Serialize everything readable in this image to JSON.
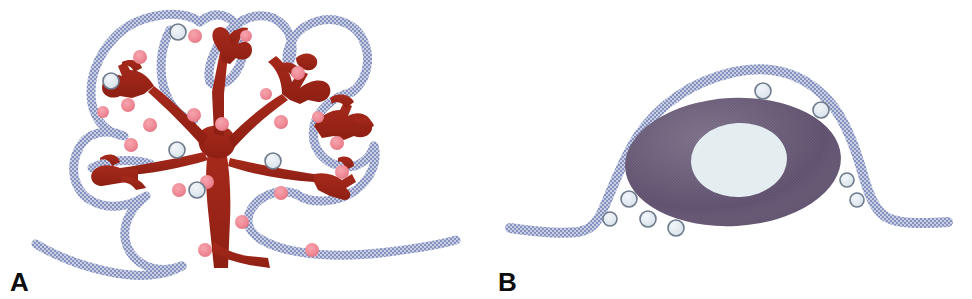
{
  "figure": {
    "kind": "scientific-illustration",
    "background_color": "#ffffff",
    "width": 972,
    "height": 299
  },
  "palette": {
    "membrane_blue": "#8f9bc4",
    "membrane_blue_light": "#c3cbe3",
    "membrane_outline": "#9aa5cb",
    "cytoplasm_red": "#a02418",
    "cytoplasm_red_dark": "#8d1f14",
    "granule_pink": "#ef8a96",
    "granule_pink_edge": "#e06878",
    "vesicle_fill": "#dfe7ee",
    "vesicle_stroke": "#6f7b8c",
    "nucleus_purple": "#5f5070",
    "nucleus_purple_light": "#7a6a8c",
    "nucleolus_pale": "#e6eef2",
    "label_black": "#0d0d0d"
  },
  "panels": [
    {
      "id": "panel-a",
      "label": "A",
      "label_name": "panel-a-label",
      "title": "Branched acinar cell profile",
      "elements": {
        "membrane_name": "plasma-membrane-outline",
        "cytoplasm_name": "branched-cytoplasm",
        "granule_name": "secretory-granule",
        "vesicle_name": "clear-vesicle"
      },
      "counts": {
        "secretory_granules": 21,
        "clear_vesicles": 5
      },
      "granules": [
        {
          "cx": 195,
          "cy": 36,
          "r": 7
        },
        {
          "cx": 140,
          "cy": 57,
          "r": 7
        },
        {
          "cx": 128,
          "cy": 105,
          "r": 7
        },
        {
          "cx": 150,
          "cy": 125,
          "r": 7
        },
        {
          "cx": 194,
          "cy": 115,
          "r": 7
        },
        {
          "cx": 222,
          "cy": 124,
          "r": 7
        },
        {
          "cx": 298,
          "cy": 73,
          "r": 7
        },
        {
          "cx": 281,
          "cy": 122,
          "r": 7
        },
        {
          "cx": 337,
          "cy": 143,
          "r": 7
        },
        {
          "cx": 131,
          "cy": 145,
          "r": 7
        },
        {
          "cx": 342,
          "cy": 172,
          "r": 7
        },
        {
          "cx": 179,
          "cy": 190,
          "r": 7
        },
        {
          "cx": 207,
          "cy": 182,
          "r": 7
        },
        {
          "cx": 281,
          "cy": 193,
          "r": 7
        },
        {
          "cx": 242,
          "cy": 222,
          "r": 7
        },
        {
          "cx": 205,
          "cy": 250,
          "r": 7
        },
        {
          "cx": 312,
          "cy": 250,
          "r": 7
        },
        {
          "cx": 246,
          "cy": 36,
          "r": 6
        },
        {
          "cx": 266,
          "cy": 94,
          "r": 6
        },
        {
          "cx": 103,
          "cy": 112,
          "r": 6
        },
        {
          "cx": 318,
          "cy": 117,
          "r": 6
        }
      ],
      "vesicles": [
        {
          "cx": 178,
          "cy": 32,
          "r": 8
        },
        {
          "cx": 111,
          "cy": 81,
          "r": 8
        },
        {
          "cx": 177,
          "cy": 150,
          "r": 8
        },
        {
          "cx": 273,
          "cy": 161,
          "r": 8
        },
        {
          "cx": 197,
          "cy": 190,
          "r": 8
        }
      ]
    },
    {
      "id": "panel-b",
      "label": "B",
      "label_name": "panel-b-label",
      "title": "Flattened cell with nucleus profile",
      "elements": {
        "membrane_name": "plasma-membrane-outline",
        "cell_body_name": "nucleus-body",
        "nucleolus_name": "nucleolus",
        "vesicle_name": "clear-vesicle"
      },
      "counts": {
        "clear_vesicles": 8
      },
      "cell_body": {
        "cx": 247,
        "cy": 162,
        "rx": 108,
        "ry": 64,
        "rotation": -3
      },
      "nucleolus": {
        "cx": 253,
        "cy": 160,
        "rx": 48,
        "ry": 37,
        "rotation": -3
      },
      "vesicles": [
        {
          "cx": 277,
          "cy": 91,
          "r": 8
        },
        {
          "cx": 335,
          "cy": 110,
          "r": 8
        },
        {
          "cx": 361,
          "cy": 180,
          "r": 7
        },
        {
          "cx": 371,
          "cy": 200,
          "r": 7
        },
        {
          "cx": 143,
          "cy": 199,
          "r": 8
        },
        {
          "cx": 124,
          "cy": 219,
          "r": 7
        },
        {
          "cx": 162,
          "cy": 219,
          "r": 8
        },
        {
          "cx": 190,
          "cy": 228,
          "r": 8
        }
      ]
    }
  ]
}
